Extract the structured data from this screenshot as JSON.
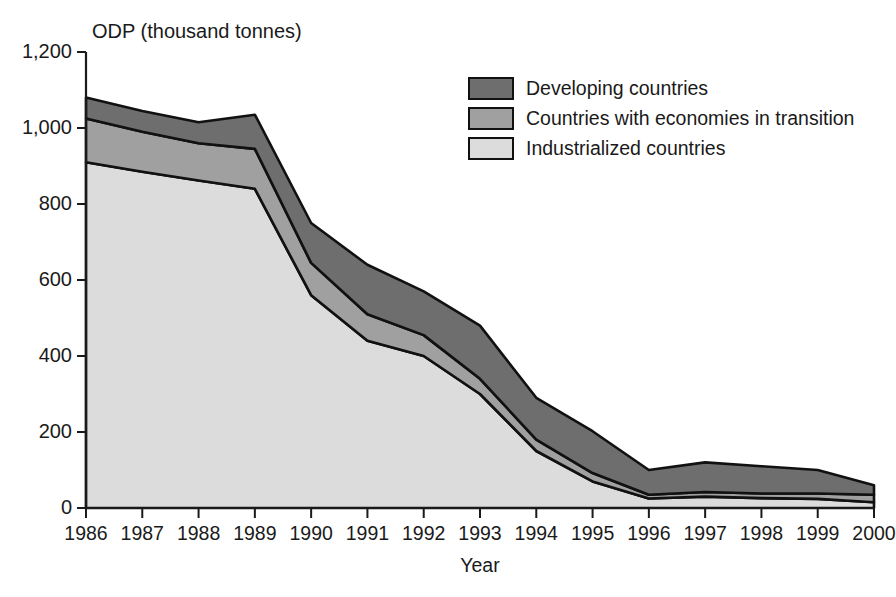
{
  "chart_data": {
    "type": "area",
    "stacked": true,
    "title": "",
    "ylabel": "ODP (thousand tonnes)",
    "xlabel": "Year",
    "grid": false,
    "legend_position": "top-right",
    "categories": [
      "1986",
      "1987",
      "1988",
      "1989",
      "1990",
      "1991",
      "1992",
      "1993",
      "1994",
      "1995",
      "1996",
      "1997",
      "1998",
      "1999",
      "2000"
    ],
    "x": [
      1986,
      1987,
      1988,
      1989,
      1990,
      1991,
      1992,
      1993,
      1994,
      1995,
      1996,
      1997,
      1998,
      1999,
      2000
    ],
    "ylim": [
      0,
      1200
    ],
    "xlim": [
      1986,
      2000
    ],
    "ytick_values": [
      0,
      200,
      400,
      600,
      800,
      1000,
      1200
    ],
    "ytick_labels": [
      "0",
      "200",
      "400",
      "600",
      "800",
      "1,000",
      "1,200"
    ],
    "series": [
      {
        "name": "Industrialized countries",
        "color": "#dcdcdc",
        "values": [
          910,
          885,
          862,
          840,
          560,
          440,
          400,
          300,
          150,
          70,
          25,
          30,
          26,
          24,
          15
        ]
      },
      {
        "name": "Countries with economies in transition",
        "color": "#a0a0a0",
        "values": [
          115,
          105,
          98,
          105,
          85,
          70,
          55,
          40,
          30,
          22,
          10,
          12,
          12,
          14,
          20
        ]
      },
      {
        "name": "Developing countries",
        "color": "#6e6e6e",
        "values": [
          55,
          55,
          55,
          90,
          105,
          130,
          115,
          140,
          110,
          110,
          65,
          78,
          72,
          62,
          25
        ]
      }
    ],
    "cumulative_totals": [
      1080,
      1045,
      1015,
      1035,
      750,
      640,
      570,
      480,
      290,
      202,
      100,
      120,
      110,
      100,
      60
    ]
  },
  "legend": {
    "items": [
      {
        "label": "Developing countries",
        "color": "#6e6e6e"
      },
      {
        "label": "Countries with economies in transition",
        "color": "#a0a0a0"
      },
      {
        "label": "Industrialized countries",
        "color": "#dcdcdc"
      }
    ]
  }
}
